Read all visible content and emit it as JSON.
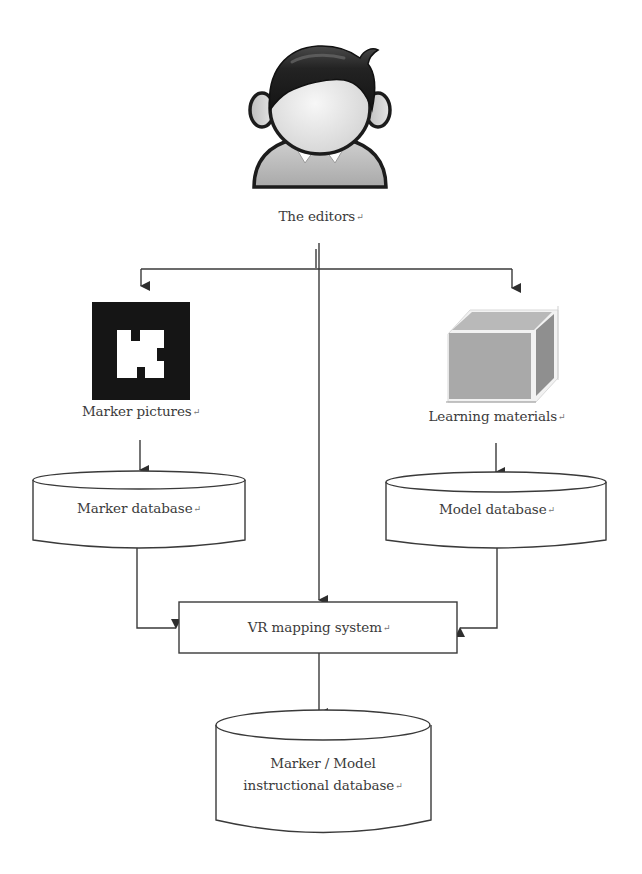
{
  "diagram": {
    "type": "flowchart",
    "nodes": {
      "editors": {
        "label": "The editors",
        "shape": "person-icon"
      },
      "marker_pictures": {
        "label": "Marker pictures",
        "shape": "marker-image"
      },
      "learning_materials": {
        "label": "Learning materials",
        "shape": "cube-icon"
      },
      "marker_database": {
        "label": "Marker database",
        "shape": "cylinder"
      },
      "model_database": {
        "label": "Model database",
        "shape": "cylinder"
      },
      "vr_mapping_system": {
        "label": "VR mapping system",
        "shape": "rectangle"
      },
      "instructional_database": {
        "label_line1": "Marker / Model",
        "label_line2": "instructional database",
        "shape": "cylinder"
      }
    },
    "return_mark": "↵",
    "edges": [
      {
        "from": "editors",
        "to": "marker_pictures"
      },
      {
        "from": "editors",
        "to": "learning_materials"
      },
      {
        "from": "editors",
        "to": "vr_mapping_system"
      },
      {
        "from": "marker_pictures",
        "to": "marker_database"
      },
      {
        "from": "learning_materials",
        "to": "model_database"
      },
      {
        "from": "marker_database",
        "to": "vr_mapping_system"
      },
      {
        "from": "model_database",
        "to": "vr_mapping_system"
      },
      {
        "from": "vr_mapping_system",
        "to": "instructional_database"
      }
    ],
    "colors": {
      "line": "#3a3a3a",
      "text": "#3b3b3b",
      "cube_face": "#a8a8a8",
      "cube_top": "#b5b5b5",
      "cube_side": "#8e8e8e",
      "marker_black": "#151515",
      "hair": "#2a2a2a",
      "skin": "#e8e8e8",
      "shirt": "#bdbdbd"
    }
  }
}
